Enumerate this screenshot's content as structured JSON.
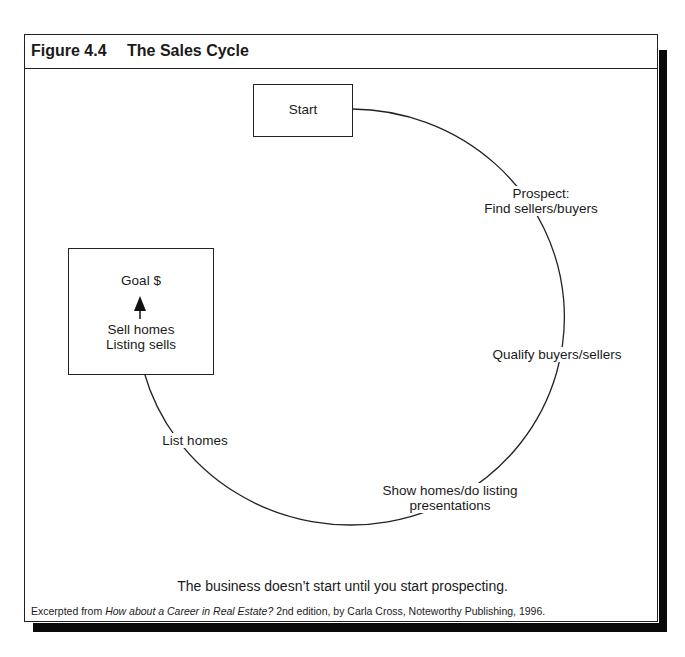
{
  "figure": {
    "number": "Figure 4.4",
    "title": "The Sales Cycle"
  },
  "diagram": {
    "start_box": "Start",
    "goal_box": {
      "title": "Goal $",
      "line1": "Sell homes",
      "line2": "Listing sells"
    },
    "steps": [
      {
        "line1": "Prospect:",
        "line2": "Find sellers/buyers"
      },
      {
        "line1": "Qualify buyers/sellers"
      },
      {
        "line1": "Show homes/do listing",
        "line2": "presentations"
      },
      {
        "line1": "List homes"
      }
    ],
    "stroke_color": "#222222"
  },
  "caption": "The business doesn’t start until you start prospecting.",
  "credit": {
    "prefix": "Excerpted from ",
    "book_title": "How about a Career in Real Estate?",
    "suffix": " 2nd edition, by Carla Cross, Noteworthy Publishing, 1996."
  }
}
